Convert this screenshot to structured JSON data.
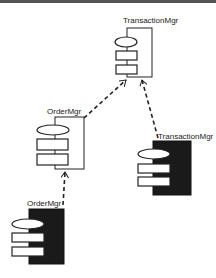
{
  "diagram": {
    "type": "UML deployment/component diagram",
    "components": [
      {
        "id": "txn_top",
        "label": "TransactionMgr",
        "style": "outline"
      },
      {
        "id": "order_mid",
        "label": "OrderMgr",
        "style": "outline"
      },
      {
        "id": "txn_right",
        "label": "TransactionMgr",
        "style": "filled"
      },
      {
        "id": "order_bottom",
        "label": "OrderMgr",
        "style": "filled"
      }
    ],
    "edges": [
      {
        "from": "order_mid",
        "to": "txn_top",
        "style": "dashed-arrow"
      },
      {
        "from": "txn_right",
        "to": "txn_top",
        "style": "dashed-arrow"
      },
      {
        "from": "order_bottom",
        "to": "order_mid",
        "style": "dashed-arrow"
      }
    ],
    "colors": {
      "line": "#222222",
      "fill_dark": "#1a1a1a",
      "background": "#ffffff"
    }
  }
}
